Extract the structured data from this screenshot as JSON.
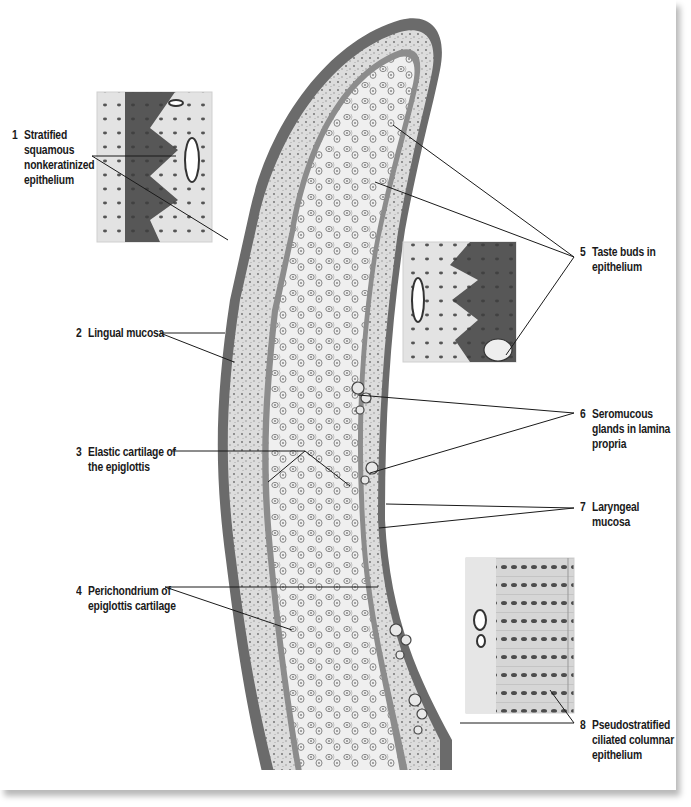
{
  "figure": {
    "colors": {
      "background": "#ffffff",
      "ink": "#1a1a1a",
      "epithelium_dark": "#5c5c5c",
      "mucosa_light": "#d8d8d8",
      "cartilage": "#ececec",
      "shadow": "#bdbdbd"
    }
  },
  "labels": [
    {
      "num": "1",
      "text": "Stratified\nsquamous\nnonkeratinized\nepithelium",
      "x": 12,
      "y": 128
    },
    {
      "num": "2",
      "text": "Lingual mucosa",
      "x": 76,
      "y": 326
    },
    {
      "num": "3",
      "text": "Elastic cartilage of\nthe epiglottis",
      "x": 76,
      "y": 445
    },
    {
      "num": "4",
      "text": "Perichondrium of\nepiglottis cartilage",
      "x": 76,
      "y": 584
    },
    {
      "num": "5",
      "text": "Taste buds in\nepithelium",
      "x": 580,
      "y": 245
    },
    {
      "num": "6",
      "text": "Seromucous\nglands in lamina\npropria",
      "x": 580,
      "y": 407
    },
    {
      "num": "7",
      "text": "Laryngeal\nmucosa",
      "x": 580,
      "y": 500
    },
    {
      "num": "8",
      "text": "Pseudostratified\nciliated columnar\nepithelium",
      "x": 580,
      "y": 718
    }
  ],
  "insets": [
    {
      "name": "inset-stratified-squamous",
      "x": 97,
      "y": 92,
      "w": 115,
      "h": 150
    },
    {
      "name": "inset-taste-buds",
      "x": 403,
      "y": 242,
      "w": 113,
      "h": 120
    },
    {
      "name": "inset-pseudostratified",
      "x": 466,
      "y": 558,
      "w": 108,
      "h": 155
    }
  ],
  "leader_lines": [
    {
      "label": "1",
      "points": [
        [
          92,
          156
        ],
        [
          176,
          156
        ]
      ]
    },
    {
      "label": "1",
      "points": [
        [
          92,
          156
        ],
        [
          228,
          240
        ]
      ]
    },
    {
      "label": "2",
      "points": [
        [
          160,
          333
        ],
        [
          225,
          333
        ]
      ]
    },
    {
      "label": "2",
      "points": [
        [
          160,
          333
        ],
        [
          234,
          362
        ]
      ]
    },
    {
      "label": "3",
      "points": [
        [
          172,
          451
        ],
        [
          305,
          451
        ]
      ]
    },
    {
      "label": "3",
      "points": [
        [
          305,
          451
        ],
        [
          268,
          482
        ]
      ]
    },
    {
      "label": "3",
      "points": [
        [
          305,
          451
        ],
        [
          350,
          486
        ]
      ]
    },
    {
      "label": "4",
      "points": [
        [
          165,
          587
        ],
        [
          378,
          587
        ]
      ]
    },
    {
      "label": "4",
      "points": [
        [
          165,
          587
        ],
        [
          292,
          630
        ]
      ]
    },
    {
      "label": "5",
      "points": [
        [
          574,
          257
        ],
        [
          393,
          125
        ]
      ]
    },
    {
      "label": "5",
      "points": [
        [
          574,
          257
        ],
        [
          375,
          182
        ]
      ]
    },
    {
      "label": "5",
      "points": [
        [
          574,
          257
        ],
        [
          506,
          355
        ]
      ]
    },
    {
      "label": "6",
      "points": [
        [
          574,
          413
        ],
        [
          358,
          395
        ]
      ]
    },
    {
      "label": "6",
      "points": [
        [
          574,
          413
        ],
        [
          370,
          473
        ]
      ]
    },
    {
      "label": "7",
      "points": [
        [
          574,
          508
        ],
        [
          386,
          504
        ]
      ]
    },
    {
      "label": "7",
      "points": [
        [
          574,
          508
        ],
        [
          379,
          528
        ]
      ]
    },
    {
      "label": "8",
      "points": [
        [
          574,
          723
        ],
        [
          460,
          723
        ]
      ]
    },
    {
      "label": "8",
      "points": [
        [
          574,
          723
        ],
        [
          550,
          690
        ]
      ]
    }
  ]
}
